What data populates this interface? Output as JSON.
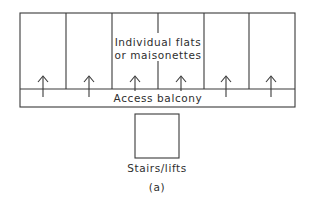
{
  "diagram": {
    "units_label_line1": "Individual flats",
    "units_label_line2": "or maisonettes",
    "balcony_label": "Access balcony",
    "stairs_label": "Stairs/lifts",
    "caption": "(a)",
    "unit_count": 6,
    "units": [
      {
        "name": "unit-1",
        "entry_arrow": "up"
      },
      {
        "name": "unit-2",
        "entry_arrow": "up"
      },
      {
        "name": "unit-3",
        "entry_arrow": "up"
      },
      {
        "name": "unit-4",
        "entry_arrow": "up"
      },
      {
        "name": "unit-5",
        "entry_arrow": "up"
      },
      {
        "name": "unit-6",
        "entry_arrow": "up"
      }
    ],
    "colors": {
      "line": "#3a3a3a",
      "text": "#2e2e2e",
      "background": "#ffffff"
    }
  }
}
